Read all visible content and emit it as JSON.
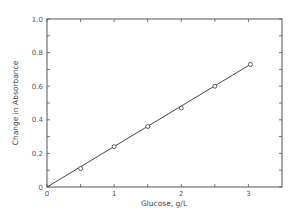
{
  "chart_data": {
    "type": "line",
    "title": "",
    "xlabel": "Glucose, g/L",
    "ylabel": "Change in Absorbance",
    "xlim": [
      0,
      3.5
    ],
    "ylim": [
      0,
      1.0
    ],
    "grid": false,
    "legend": null,
    "x_ticks": [
      0,
      1,
      2,
      3
    ],
    "x_tick_labels": [
      "0",
      "1",
      "2",
      "3"
    ],
    "x_minor_ticks": [
      0.5,
      1.5,
      2.5
    ],
    "y_ticks": [
      0,
      0.2,
      0.4,
      0.6,
      0.8,
      1.0
    ],
    "y_tick_labels": [
      "0",
      "0.2",
      "0.4",
      "0.6",
      "0.8",
      "1.0"
    ],
    "y_minor_ticks": [
      0.1,
      0.3,
      0.5,
      0.7,
      0.9
    ],
    "series": [
      {
        "name": "measured",
        "marker": "open-circle",
        "x": [
          0.5,
          1.0,
          1.5,
          2.0,
          2.5,
          3.03
        ],
        "y": [
          0.11,
          0.24,
          0.36,
          0.47,
          0.6,
          0.73
        ]
      },
      {
        "name": "fit-line",
        "style": "solid",
        "x": [
          0,
          3.03
        ],
        "y": [
          0,
          0.73
        ]
      }
    ],
    "colors": {
      "axis": "#555555",
      "line": "#333333",
      "marker": "#333333"
    }
  }
}
